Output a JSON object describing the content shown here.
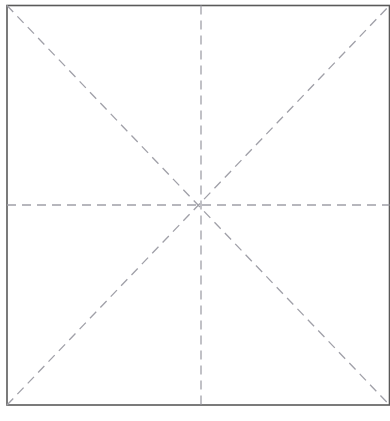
{
  "figure": {
    "title": "Square crease pattern with eight radial fold lines",
    "caption": "",
    "background_color": "#ffffff",
    "width": 390,
    "height": 421
  },
  "colors": {
    "border": "#5a5a5a",
    "crease": "#a0a0a8",
    "background": "#ffffff"
  },
  "square": {
    "name": "paper-outline",
    "left": 7,
    "top": 5.5,
    "right": 389.5,
    "bottom": 405,
    "stroke_width": 1.6,
    "stroke": "#5a5a5a",
    "fill": "#ffffff"
  },
  "center": {
    "name": "center-point",
    "x": 201,
    "y": 205
  },
  "crease_style": {
    "stroke": "#a0a0a8",
    "stroke_width": 1.3,
    "dash_length": 9,
    "dash_gap": 6,
    "dash_array": "9 6"
  },
  "creases": [
    {
      "name": "crease-horizontal",
      "label": "horizontal centerline",
      "x1": 7,
      "y1": 205,
      "x2": 389.5,
      "y2": 205
    },
    {
      "name": "crease-vertical",
      "label": "vertical centerline",
      "x1": 201,
      "y1": 5.5,
      "x2": 201,
      "y2": 405
    },
    {
      "name": "crease-diagonal-tl-br",
      "label": "diagonal top-left to bottom-right",
      "x1": 7,
      "y1": 5.5,
      "x2": 389.5,
      "y2": 405
    },
    {
      "name": "crease-diagonal-bl-tr",
      "label": "diagonal bottom-left to top-right",
      "x1": 7,
      "y1": 405,
      "x2": 389.5,
      "y2": 5.5
    }
  ]
}
